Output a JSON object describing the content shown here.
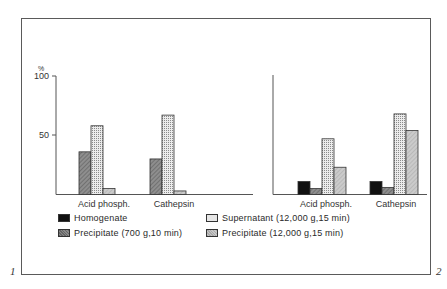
{
  "figure": {
    "panel_numbers": [
      "1",
      "2"
    ]
  },
  "chart_data": [
    {
      "type": "bar",
      "title": "",
      "ylabel": "%",
      "xlabel": "",
      "ylim": [
        0,
        100
      ],
      "yticks": [
        50,
        100
      ],
      "categories": [
        "Acid phosph.",
        "Cathepsin"
      ],
      "series": [
        {
          "name": "Precipitate (700 g, 10 min)",
          "values": [
            36,
            30
          ]
        },
        {
          "name": "Supernatant (12,000 g, 15 min)",
          "values": [
            58,
            67
          ]
        },
        {
          "name": "Precipitate (12,000 g, 15 min)",
          "values": [
            5,
            3
          ]
        }
      ]
    },
    {
      "type": "bar",
      "title": "",
      "ylabel": "%",
      "xlabel": "",
      "ylim": [
        0,
        100
      ],
      "categories": [
        "Acid phosph.",
        "Cathepsin"
      ],
      "series": [
        {
          "name": "Homogenate",
          "values": [
            11,
            11
          ]
        },
        {
          "name": "Precipitate (700 g, 10 min)",
          "values": [
            5,
            6
          ]
        },
        {
          "name": "Supernatant (12,000 g, 15 min)",
          "values": [
            47,
            68
          ]
        },
        {
          "name": "Precipitate (12,000 g, 15 min)",
          "values": [
            23,
            54
          ]
        }
      ]
    }
  ],
  "axis": {
    "unit_label": "%",
    "tick_100": "100",
    "tick_50": "50"
  },
  "left_chart": {
    "category_labels": [
      "Acid phosph.",
      "Cathepsin"
    ]
  },
  "right_chart": {
    "category_labels": [
      "Acid phosph.",
      "Cathepsin"
    ]
  },
  "legend": {
    "items": [
      {
        "key": "homogenate",
        "label": "Homogenate"
      },
      {
        "key": "precip700",
        "label": "Precipitate (700 g,10 min)"
      },
      {
        "key": "supernatant",
        "label": "Supernatant (12,000 g,15 min)"
      },
      {
        "key": "precip12000",
        "label": "Precipitate (12,000 g,15 min)"
      }
    ]
  },
  "colors": {
    "homogenate": "#111111",
    "precip700": "#8a8a8a",
    "supernatant": "#e6e6e6",
    "precip12000": "#c8c8c8",
    "axis": "#555555"
  }
}
